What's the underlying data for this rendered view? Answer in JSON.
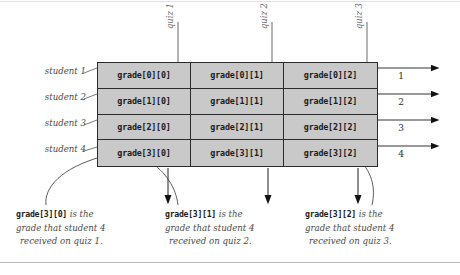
{
  "diagram": {
    "grid": {
      "rows": [
        {
          "cells": [
            "grade[0][0]",
            "grade[0][1]",
            "grade[0][2]"
          ]
        },
        {
          "cells": [
            "grade[1][0]",
            "grade[1][1]",
            "grade[1][2]"
          ]
        },
        {
          "cells": [
            "grade[2][0]",
            "grade[2][1]",
            "grade[2][2]"
          ]
        },
        {
          "cells": [
            "grade[3][0]",
            "grade[3][1]",
            "grade[3][2]"
          ]
        }
      ]
    },
    "row_labels": [
      "student 1",
      "student 2",
      "student 3",
      "student 4"
    ],
    "column_labels": [
      "quiz 1",
      "quiz 2",
      "quiz 3"
    ],
    "row_numbers": [
      "1",
      "2",
      "3",
      "4"
    ],
    "captions": [
      {
        "code": "grade[3][0]",
        "line1_rest": " is the",
        "line2": "grade that student 4",
        "line3": "received on quiz 1."
      },
      {
        "code": "grade[3][1]",
        "line1_rest": " is the",
        "line2": "grade that student 4",
        "line3": "received on quiz 2."
      },
      {
        "code": "grade[3][2]",
        "line1_rest": " is the",
        "line2": "grade that student 4",
        "line3": "received on quiz 3."
      }
    ],
    "colors": {
      "cell_fill": "#c9c9c9",
      "line": "#2b2b2b",
      "text_muted": "#4a4a4a",
      "background": "#ffffff"
    }
  }
}
